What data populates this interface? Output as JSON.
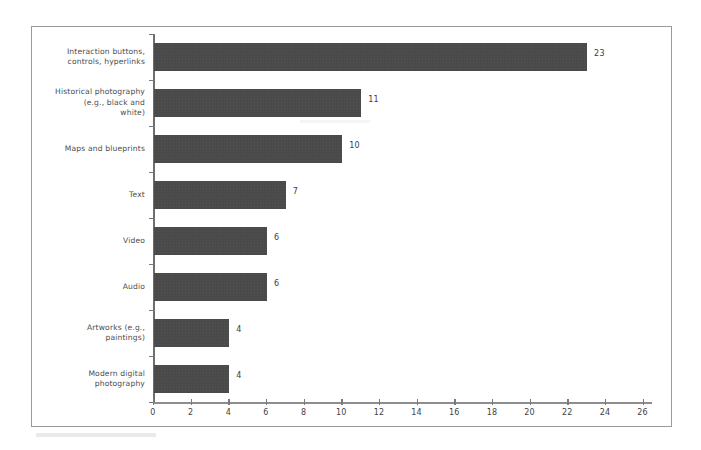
{
  "chart_data": {
    "type": "bar",
    "orientation": "horizontal",
    "title": "",
    "subtitle": "",
    "xlabel": "",
    "ylabel": "",
    "categories": [
      "Interaction buttons, controls, hyperlinks",
      "Historical photography (e.g., black and white)",
      "Maps and blueprints",
      "Text",
      "Video",
      "Audio",
      "Artworks (e.g., paintings)",
      "Modern digital photography"
    ],
    "category_lines": [
      [
        "Interaction buttons,",
        "controls, hyperlinks"
      ],
      [
        "Historical photography",
        "(e.g., black and",
        "white)"
      ],
      [
        "Maps and blueprints"
      ],
      [
        "Text"
      ],
      [
        "Video"
      ],
      [
        "Audio"
      ],
      [
        "Artworks (e.g.,",
        "paintings)"
      ],
      [
        "Modern digital",
        "photography"
      ]
    ],
    "values": [
      23,
      11,
      10,
      7,
      6,
      6,
      4,
      4
    ],
    "value_labels": [
      "23",
      "11",
      "10",
      "7",
      "6",
      "6",
      "4",
      "4"
    ],
    "xlim": [
      0,
      26.5
    ],
    "xticks": [
      0,
      2,
      4,
      6,
      8,
      10,
      12,
      14,
      16,
      18,
      20,
      22,
      24,
      26
    ],
    "xtick_labels": [
      "0",
      "2",
      "4",
      "6",
      "8",
      "10",
      "12",
      "14",
      "16",
      "18",
      "20",
      "22",
      "24",
      "26"
    ],
    "grid": false,
    "legend": false,
    "legend_position": "none",
    "bar_color": "#4a4a4a",
    "axis_color": "#7a7a7a",
    "frame_color": "#9a9a9a",
    "background_color": "#ffffff"
  }
}
